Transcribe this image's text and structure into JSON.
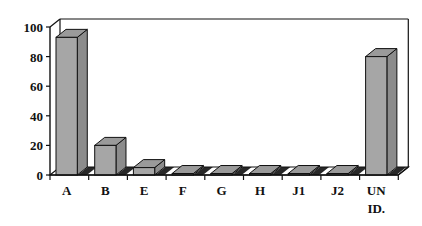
{
  "chart_data": {
    "type": "bar",
    "style": "3d-column",
    "title": "",
    "xlabel": "",
    "ylabel": "",
    "categories": [
      "A",
      "B",
      "E",
      "F",
      "G",
      "H",
      "J1",
      "J2",
      "UN ID."
    ],
    "category_label_lines": [
      [
        "A"
      ],
      [
        "B"
      ],
      [
        "E"
      ],
      [
        "F"
      ],
      [
        "G"
      ],
      [
        "H"
      ],
      [
        "J1"
      ],
      [
        "J2"
      ],
      [
        "UN",
        "ID."
      ]
    ],
    "values": [
      93,
      20,
      5,
      1,
      1,
      1,
      1,
      1,
      80
    ],
    "ylim": [
      0,
      100
    ],
    "yticks": [
      0,
      20,
      40,
      60,
      80,
      100
    ],
    "grid": false,
    "legend": null,
    "colors": {
      "bar_front": "#a6a6a6",
      "bar_top": "#9a9a9a",
      "bar_side": "#8c8c8c",
      "axis": "#111111",
      "floor_stripe": "#ffffff"
    }
  }
}
